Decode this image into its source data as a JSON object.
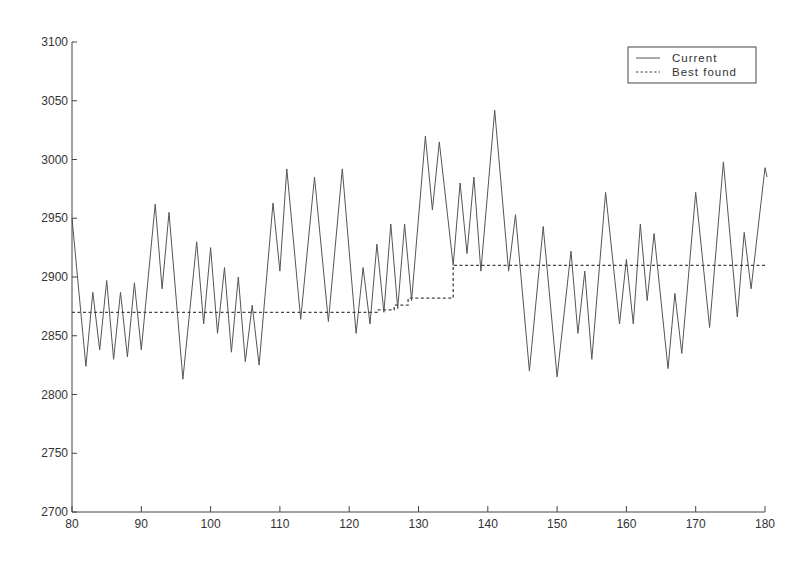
{
  "chart_data": {
    "type": "line",
    "title": "",
    "xlabel": "",
    "ylabel": "",
    "xlim": [
      80,
      180
    ],
    "ylim": [
      2700,
      3100
    ],
    "grid": false,
    "legend_position": "upper right",
    "x_ticks": [
      80,
      90,
      100,
      110,
      120,
      130,
      140,
      150,
      160,
      170,
      180
    ],
    "y_ticks": [
      2700,
      2750,
      2800,
      2850,
      2900,
      2950,
      3000,
      3050,
      3100
    ],
    "legend": [
      "Current",
      "Best found"
    ],
    "series": [
      {
        "name": "Current",
        "style": "solid",
        "color": "#555555",
        "points": [
          [
            80,
            2950
          ],
          [
            82,
            2824
          ],
          [
            83,
            2887
          ],
          [
            84,
            2838
          ],
          [
            85,
            2897
          ],
          [
            86,
            2830
          ],
          [
            87,
            2887
          ],
          [
            88,
            2832
          ],
          [
            89,
            2895
          ],
          [
            90,
            2838
          ],
          [
            92,
            2962
          ],
          [
            93,
            2890
          ],
          [
            94,
            2955
          ],
          [
            96,
            2813
          ],
          [
            98,
            2930
          ],
          [
            99,
            2860
          ],
          [
            100,
            2925
          ],
          [
            101,
            2852
          ],
          [
            102,
            2908
          ],
          [
            103,
            2836
          ],
          [
            104,
            2900
          ],
          [
            105,
            2828
          ],
          [
            106,
            2876
          ],
          [
            107,
            2825
          ],
          [
            109,
            2963
          ],
          [
            110,
            2905
          ],
          [
            111,
            2992
          ],
          [
            113,
            2864
          ],
          [
            115,
            2985
          ],
          [
            117,
            2862
          ],
          [
            119,
            2992
          ],
          [
            121,
            2852
          ],
          [
            122,
            2908
          ],
          [
            123,
            2860
          ],
          [
            124,
            2928
          ],
          [
            125,
            2870
          ],
          [
            126,
            2945
          ],
          [
            127,
            2873
          ],
          [
            128,
            2945
          ],
          [
            129,
            2880
          ],
          [
            131,
            3020
          ],
          [
            132,
            2957
          ],
          [
            133,
            3015
          ],
          [
            135,
            2910
          ],
          [
            136,
            2980
          ],
          [
            137,
            2920
          ],
          [
            138,
            2985
          ],
          [
            139,
            2905
          ],
          [
            141,
            3042
          ],
          [
            143,
            2905
          ],
          [
            144,
            2953
          ],
          [
            146,
            2820
          ],
          [
            148,
            2943
          ],
          [
            150,
            2815
          ],
          [
            152,
            2922
          ],
          [
            153,
            2852
          ],
          [
            154,
            2905
          ],
          [
            155,
            2830
          ],
          [
            157,
            2972
          ],
          [
            159,
            2860
          ],
          [
            160,
            2915
          ],
          [
            161,
            2860
          ],
          [
            162,
            2945
          ],
          [
            163,
            2880
          ],
          [
            164,
            2937
          ],
          [
            166,
            2822
          ],
          [
            167,
            2886
          ],
          [
            168,
            2835
          ],
          [
            170,
            2972
          ],
          [
            172,
            2857
          ],
          [
            174,
            2998
          ],
          [
            176,
            2866
          ],
          [
            177,
            2938
          ],
          [
            178,
            2890
          ],
          [
            180,
            2993
          ],
          [
            180.3,
            2985
          ]
        ]
      },
      {
        "name": "Best found",
        "style": "dashed",
        "color": "#444444",
        "points": [
          [
            80,
            2870
          ],
          [
            124,
            2870
          ],
          [
            124,
            2872
          ],
          [
            126.5,
            2872
          ],
          [
            126.5,
            2876
          ],
          [
            128.5,
            2876
          ],
          [
            128.5,
            2882
          ],
          [
            135,
            2882
          ],
          [
            135,
            2910
          ],
          [
            180,
            2910
          ]
        ]
      }
    ]
  },
  "legend": {
    "current_label": "Current",
    "best_label": "Best found"
  }
}
